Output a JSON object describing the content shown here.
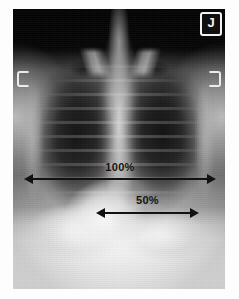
{
  "image": {
    "modality": "chest-radiograph",
    "view": "PA",
    "side_marker": "J",
    "background_color": "#050505",
    "paper_color": "#ffffff",
    "annotation_color": "#121212"
  },
  "annotations": {
    "thoracic": {
      "label": "100%",
      "name": "thoracic-width-measure"
    },
    "cardiac": {
      "label": "50%",
      "name": "cardiac-width-measure"
    }
  },
  "chart_data": {
    "type": "bar",
    "categories": [
      "100%",
      "50%"
    ],
    "values": [
      100,
      50
    ],
    "xlabel": "",
    "ylabel": "Percent of thoracic width",
    "ylim": [
      0,
      100
    ],
    "grid": false,
    "legend": "none",
    "annotations": [
      {
        "label": "100%",
        "meaning": "maximum internal thoracic (rib cage) transverse diameter",
        "value": 100,
        "units": "percent",
        "arrow": "double-headed",
        "x_start_px": 11,
        "x_end_px": 230,
        "y_px": 178
      },
      {
        "label": "50%",
        "meaning": "maximum transverse cardiac diameter",
        "value": 50,
        "units": "percent",
        "arrow": "double-headed",
        "x_start_px": 83,
        "x_end_px": 213,
        "y_px": 212
      }
    ]
  }
}
